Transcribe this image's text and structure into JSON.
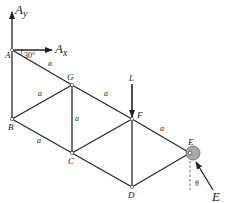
{
  "diagram": {
    "type": "truss",
    "nodes": [
      {
        "id": "A",
        "label": "A",
        "x": 12,
        "y": 50,
        "lx": 5,
        "ly": 58
      },
      {
        "id": "G",
        "label": "G",
        "x": 72,
        "y": 85,
        "lx": 67,
        "ly": 80
      },
      {
        "id": "B",
        "label": "B",
        "x": 12,
        "y": 119,
        "lx": 8,
        "ly": 130
      },
      {
        "id": "C",
        "label": "C",
        "x": 72,
        "y": 153,
        "lx": 68,
        "ly": 164
      },
      {
        "id": "F",
        "label": "F",
        "x": 132,
        "y": 119,
        "lx": 137,
        "ly": 118
      },
      {
        "id": "D",
        "label": "D",
        "x": 132,
        "y": 187,
        "lx": 128,
        "ly": 198
      },
      {
        "id": "E",
        "label": "E",
        "x": 190,
        "y": 153,
        "lx": 188,
        "ly": 145
      }
    ],
    "members": [
      {
        "from": "A",
        "to": "G",
        "label": "a",
        "lx": 48,
        "ly": 66
      },
      {
        "from": "G",
        "to": "F",
        "label": "a",
        "lx": 104,
        "ly": 96
      },
      {
        "from": "F",
        "to": "E",
        "label": "a",
        "lx": 160,
        "ly": 131
      },
      {
        "from": "A",
        "to": "B",
        "label": "",
        "lx": 0,
        "ly": 0
      },
      {
        "from": "B",
        "to": "G",
        "label": "a",
        "lx": 38,
        "ly": 96
      },
      {
        "from": "G",
        "to": "C",
        "label": "a",
        "lx": 75,
        "ly": 121
      },
      {
        "from": "B",
        "to": "C",
        "label": "a",
        "lx": 37,
        "ly": 143
      },
      {
        "from": "C",
        "to": "F",
        "label": "",
        "lx": 0,
        "ly": 0
      },
      {
        "from": "F",
        "to": "D",
        "label": "",
        "lx": 0,
        "ly": 0
      },
      {
        "from": "C",
        "to": "D",
        "label": "",
        "lx": 0,
        "ly": 0
      },
      {
        "from": "D",
        "to": "E",
        "label": "",
        "lx": 0,
        "ly": 0
      }
    ],
    "forces": {
      "Ay": {
        "label": "A",
        "sub": "y"
      },
      "Ax": {
        "label": "A",
        "sub": "x"
      },
      "L": {
        "label": "L"
      },
      "E": {
        "label": "E"
      }
    },
    "angles": {
      "A": "30°",
      "E": "θ"
    },
    "roller_color": "#a8a8a8"
  }
}
